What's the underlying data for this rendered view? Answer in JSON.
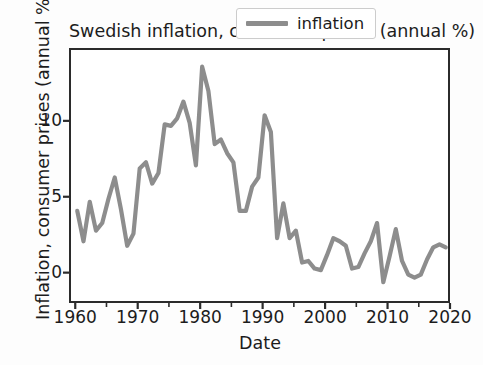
{
  "chart_data": {
    "type": "line",
    "title": "Swedish inflation, consumer prices (annual %)",
    "xlabel": "Date",
    "ylabel": "Inflation, consumer prices (annual %)",
    "xlim": [
      1959.0,
      2020.0
    ],
    "ylim": [
      -2.0,
      14.8
    ],
    "grid": false,
    "legend_position": "upper right",
    "series": [
      {
        "name": "inflation",
        "color": "#8d8d8d",
        "x": [
          1960,
          1961,
          1962,
          1963,
          1964,
          1965,
          1966,
          1967,
          1968,
          1969,
          1970,
          1971,
          1972,
          1973,
          1974,
          1975,
          1976,
          1977,
          1978,
          1979,
          1980,
          1981,
          1982,
          1983,
          1984,
          1985,
          1986,
          1987,
          1988,
          1989,
          1990,
          1991,
          1992,
          1993,
          1994,
          1995,
          1996,
          1997,
          1998,
          1999,
          2000,
          2001,
          2002,
          2003,
          2004,
          2005,
          2006,
          2007,
          2008,
          2009,
          2010,
          2011,
          2012,
          2013,
          2014,
          2015,
          2016,
          2017,
          2018,
          2019
        ],
        "values": [
          4.2,
          2.2,
          4.8,
          2.9,
          3.4,
          5.0,
          6.4,
          4.3,
          1.9,
          2.7,
          7.0,
          7.4,
          6.0,
          6.7,
          9.9,
          9.8,
          10.3,
          11.4,
          10.0,
          7.2,
          13.7,
          12.1,
          8.6,
          8.9,
          8.0,
          7.4,
          4.2,
          4.2,
          5.8,
          6.4,
          10.5,
          9.4,
          2.4,
          4.7,
          2.4,
          2.9,
          0.8,
          0.9,
          0.4,
          0.3,
          1.3,
          2.4,
          2.2,
          1.9,
          0.4,
          0.5,
          1.4,
          2.2,
          3.4,
          -0.5,
          1.2,
          3.0,
          0.9,
          0.0,
          -0.2,
          0.0,
          1.0,
          1.8,
          2.0,
          1.8
        ]
      }
    ],
    "xticks": [
      1960,
      1970,
      1980,
      1990,
      2000,
      2010,
      2020
    ],
    "xticks_minor": [
      1965,
      1975,
      1985,
      1995,
      2005,
      2015
    ],
    "yticks": [
      0,
      5,
      10
    ],
    "xtick_labels": [
      "1960",
      "1970",
      "1980",
      "1990",
      "2000",
      "2010",
      "2020"
    ],
    "ytick_labels": [
      "0",
      "5",
      "10"
    ]
  },
  "legend": {
    "entries": [
      {
        "label": "inflation",
        "color": "#8d8d8d"
      }
    ]
  },
  "colors": {
    "line": "#8d8d8d",
    "axis": "#2b2b2b",
    "text": "#1c1c1c",
    "legend_border": "#cccccc",
    "background": "#ffffff"
  }
}
